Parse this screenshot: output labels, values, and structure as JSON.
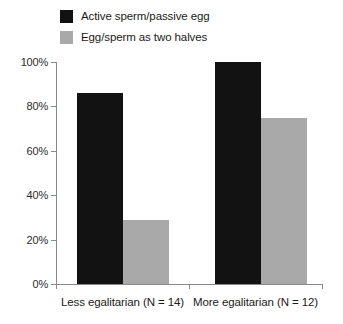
{
  "chart_data": {
    "type": "bar",
    "title": "",
    "xlabel": "",
    "ylabel": "",
    "ylim": [
      0,
      100
    ],
    "y_tick_labels": [
      "0%",
      "20%",
      "40%",
      "60%",
      "80%",
      "100%"
    ],
    "y_tick_values": [
      0,
      20,
      40,
      60,
      80,
      100
    ],
    "grid": false,
    "legend_position": "top-left",
    "categories": [
      "Less egalitarian (N = 14)",
      "More egalitarian (N = 12)"
    ],
    "series": [
      {
        "name": "Active sperm/passive egg",
        "color": "#121212",
        "values": [
          86,
          100
        ]
      },
      {
        "name": "Egg/sperm as two halves",
        "color": "#a9a9a9",
        "values": [
          29,
          75
        ]
      }
    ]
  },
  "legend": {
    "items": [
      {
        "label": "Active sperm/passive egg",
        "color": "#121212"
      },
      {
        "label": "Egg/sperm as two halves",
        "color": "#a9a9a9"
      }
    ]
  },
  "axes": {
    "y_labels": [
      "100%",
      "80%",
      "60%",
      "40%",
      "20%",
      "0%"
    ],
    "x_labels": [
      "Less egalitarian (N = 14)",
      "More egalitarian (N = 12)"
    ]
  },
  "colors": {
    "series_dark": "#121212",
    "series_light": "#a9a9a9",
    "axis": "#8a8a8a",
    "text": "#1a1a1a",
    "background": "#ffffff"
  }
}
